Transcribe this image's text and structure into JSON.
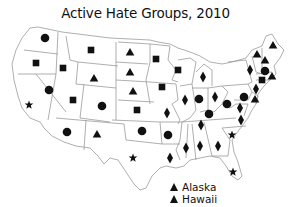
{
  "title": "Active Hate Groups, 2010",
  "symbol_color": "#111111",
  "border_color": "#9a9a9a",
  "states": [
    {
      "state": "WA",
      "symbol": "circle"
    },
    {
      "state": "OR",
      "symbol": "square"
    },
    {
      "state": "CA",
      "symbol": "star"
    },
    {
      "state": "NV",
      "symbol": "circle"
    },
    {
      "state": "ID",
      "symbol": "square"
    },
    {
      "state": "MT",
      "symbol": "square"
    },
    {
      "state": "WY",
      "symbol": "triangle"
    },
    {
      "state": "UT",
      "symbol": "square"
    },
    {
      "state": "CO",
      "symbol": "circle"
    },
    {
      "state": "AZ",
      "symbol": "circle"
    },
    {
      "state": "NM",
      "symbol": "triangle"
    },
    {
      "state": "ND",
      "symbol": "triangle"
    },
    {
      "state": "SD",
      "symbol": "triangle"
    },
    {
      "state": "NE",
      "symbol": "triangle"
    },
    {
      "state": "KS",
      "symbol": "square"
    },
    {
      "state": "OK",
      "symbol": "circle"
    },
    {
      "state": "TX",
      "symbol": "star"
    },
    {
      "state": "MN",
      "symbol": "square"
    },
    {
      "state": "IA",
      "symbol": "square"
    },
    {
      "state": "MO",
      "symbol": "diamond"
    },
    {
      "state": "AR",
      "symbol": "circle"
    },
    {
      "state": "LA",
      "symbol": "diamond"
    },
    {
      "state": "WI",
      "symbol": "square"
    },
    {
      "state": "IL",
      "symbol": "diamond"
    },
    {
      "state": "MI",
      "symbol": "diamond"
    },
    {
      "state": "IN",
      "symbol": "circle"
    },
    {
      "state": "OH",
      "symbol": "diamond"
    },
    {
      "state": "KY",
      "symbol": "circle"
    },
    {
      "state": "TN",
      "symbol": "diamond"
    },
    {
      "state": "MS",
      "symbol": "diamond"
    },
    {
      "state": "AL",
      "symbol": "diamond"
    },
    {
      "state": "GA",
      "symbol": "diamond"
    },
    {
      "state": "SC",
      "symbol": "star"
    },
    {
      "state": "FL",
      "symbol": "star"
    },
    {
      "state": "NC",
      "symbol": "diamond"
    },
    {
      "state": "VA",
      "symbol": "diamond"
    },
    {
      "state": "WV",
      "symbol": "circle"
    },
    {
      "state": "PA",
      "symbol": "circle"
    },
    {
      "state": "NY",
      "symbol": "diamond"
    },
    {
      "state": "MD",
      "symbol": "diamond"
    },
    {
      "state": "NJ",
      "symbol": "triangle"
    },
    {
      "state": "VT",
      "symbol": "triangle"
    },
    {
      "state": "NH",
      "symbol": "triangle"
    },
    {
      "state": "ME",
      "symbol": "triangle"
    },
    {
      "state": "MA",
      "symbol": "circle"
    },
    {
      "state": "CT",
      "symbol": "square"
    },
    {
      "state": "RI",
      "symbol": "triangle"
    }
  ],
  "legend": [
    {
      "label": "Alaska",
      "symbol": "triangle"
    },
    {
      "label": "Hawaii",
      "symbol": "triangle"
    }
  ]
}
